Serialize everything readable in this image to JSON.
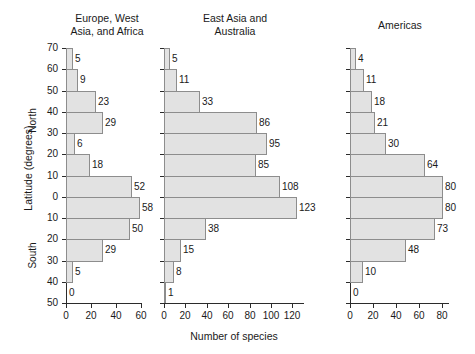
{
  "figure": {
    "ylabel": "Latitude (degrees)",
    "north_label": "North",
    "south_label": "South",
    "xlabel": "Number of species"
  },
  "chart_data": {
    "type": "bar",
    "xlabel": "Number of species",
    "ylabel": "Latitude (degrees)",
    "orientation": "horizontal",
    "grid": false,
    "legend": "none",
    "categories": [
      "60-70 N",
      "50-60 N",
      "40-50 N",
      "30-40 N",
      "20-30 N",
      "10-20 N",
      "0-10 N",
      "0-10 S",
      "10-20 S",
      "20-30 S",
      "30-40 S",
      "40-50 S"
    ],
    "latitude_ticks": [
      "70",
      "60",
      "50",
      "40",
      "30",
      "20",
      "10",
      "0",
      "10",
      "20",
      "30",
      "40",
      "50"
    ],
    "panels": [
      {
        "name": "Europe, West Asia, and Africa",
        "title_lines": [
          "Europe, West",
          "Asia, and Africa"
        ],
        "xlim": [
          0,
          60
        ],
        "xticks": [
          0,
          20,
          40,
          60
        ],
        "values": [
          5,
          9,
          23,
          29,
          6,
          18,
          52,
          58,
          50,
          29,
          5,
          0
        ]
      },
      {
        "name": "East Asia and Australia",
        "title_lines": [
          "East Asia and",
          "Australia"
        ],
        "xlim": [
          0,
          130
        ],
        "xticks": [
          0,
          20,
          40,
          60,
          80,
          100,
          120
        ],
        "values": [
          5,
          11,
          33,
          86,
          95,
          85,
          108,
          123,
          38,
          15,
          8,
          1
        ]
      },
      {
        "name": "Americas",
        "title_lines": [
          "Americas"
        ],
        "xlim": [
          0,
          85
        ],
        "xticks": [
          0,
          20,
          40,
          60,
          80
        ],
        "values": [
          4,
          11,
          18,
          21,
          30,
          64,
          80,
          80,
          73,
          48,
          10,
          0
        ]
      }
    ]
  },
  "colors": {
    "bar_fill": "#e2e2e2",
    "bar_stroke": "#8d8d8d",
    "axis": "#2b2b2b",
    "text": "#1a1a1a",
    "background": "#ffffff"
  }
}
